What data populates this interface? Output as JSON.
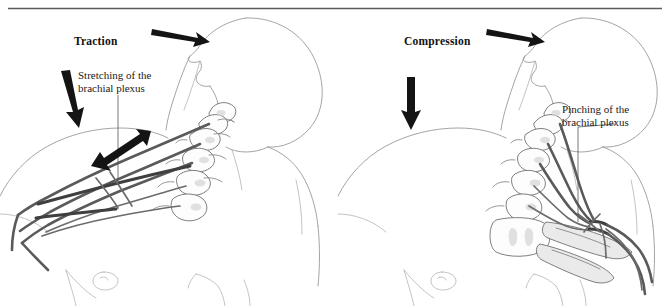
{
  "figure": {
    "width": 670,
    "height": 306,
    "background_color": "#ffffff",
    "top_rule_color": "#5b5b5b",
    "style": "medical line-art illustration"
  },
  "panels": [
    {
      "id": "traction",
      "title": "Traction",
      "title_position": {
        "x": 74,
        "y": 45
      },
      "annotation": {
        "line1": "Stretching of the",
        "line2": "brachial plexus",
        "x": 78,
        "y": 79
      },
      "arrows": [
        {
          "name": "head-direction-arrow",
          "type": "single",
          "description": "arrow pointing right toward the head",
          "from": {
            "x": 153,
            "y": 31
          },
          "to": {
            "x": 205,
            "y": 42
          }
        },
        {
          "name": "shoulder-depression-arrow",
          "type": "single",
          "description": "arrow pointing down onto the shoulder",
          "from": {
            "x": 62,
            "y": 72
          },
          "to": {
            "x": 77,
            "y": 126
          }
        },
        {
          "name": "stretch-direction-arrow",
          "type": "double",
          "description": "double-headed arrow showing nerve stretch",
          "from": {
            "x": 93,
            "y": 164
          },
          "to": {
            "x": 148,
            "y": 134
          }
        }
      ]
    },
    {
      "id": "compression",
      "title": "Compression",
      "title_position": {
        "x": 404,
        "y": 45
      },
      "annotation": {
        "line1": "Pinching of the",
        "line2": "brachial plexus",
        "x": 562,
        "y": 113
      },
      "arrows": [
        {
          "name": "head-direction-arrow",
          "type": "single",
          "description": "arrow pointing right toward the head",
          "from": {
            "x": 488,
            "y": 31
          },
          "to": {
            "x": 540,
            "y": 42
          }
        },
        {
          "name": "shoulder-elevation-arrow",
          "type": "single",
          "description": "arrow pointing straight down onto the shoulder",
          "from": {
            "x": 411,
            "y": 78
          },
          "to": {
            "x": 411,
            "y": 128
          }
        }
      ],
      "leader_line": {
        "name": "pinch-leader-line",
        "from": {
          "x": 578,
          "y": 127
        },
        "to": {
          "x": 578,
          "y": 222
        }
      }
    }
  ],
  "anatomy": {
    "labels": [
      "head",
      "neck",
      "shoulder",
      "torso",
      "cervical vertebrae",
      "nerve roots",
      "brachial plexus",
      "clavicle",
      "first rib"
    ],
    "colors": {
      "skin_outline": "#9a9a9a",
      "bone_outline": "#6f6f6f",
      "bone_fill": "#fdfdfd",
      "nerve": "#5a5a5a",
      "nerve_dark": "#3f3f3f",
      "arrow": "#141414"
    }
  }
}
